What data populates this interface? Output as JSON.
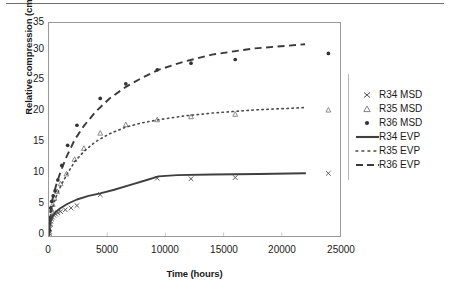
{
  "chart_data": {
    "type": "scatter",
    "title": "",
    "xlabel": "Time (hours)",
    "ylabel": "Relative compression (cm)",
    "xlim": [
      0,
      25000
    ],
    "ylim": [
      0,
      35
    ],
    "xticks": [
      0,
      5000,
      10000,
      15000,
      20000,
      25000
    ],
    "yticks": [
      0,
      5,
      10,
      15,
      20,
      25,
      30,
      35
    ],
    "grid": false,
    "legend_position": "right",
    "series": [
      {
        "name": "R34 MSD",
        "type": "scatter",
        "marker": "x",
        "color": "#555555",
        "points": [
          [
            30,
            0.4
          ],
          [
            70,
            1.2
          ],
          [
            110,
            1.9
          ],
          [
            160,
            2.4
          ],
          [
            220,
            2.8
          ],
          [
            300,
            3.1
          ],
          [
            420,
            3.4
          ],
          [
            560,
            3.6
          ],
          [
            760,
            3.8
          ],
          [
            1000,
            4.0
          ],
          [
            1400,
            4.3
          ],
          [
            1900,
            4.6
          ],
          [
            2400,
            5.0
          ],
          [
            4400,
            6.8
          ],
          [
            9300,
            9.5
          ],
          [
            12200,
            9.4
          ],
          [
            16000,
            9.6
          ],
          [
            24000,
            10.3
          ]
        ]
      },
      {
        "name": "R35 MSD",
        "type": "scatter",
        "marker": "triangle",
        "color": "#777777",
        "points": [
          [
            30,
            0.6
          ],
          [
            80,
            2.0
          ],
          [
            140,
            3.2
          ],
          [
            220,
            4.3
          ],
          [
            330,
            5.2
          ],
          [
            480,
            6.2
          ],
          [
            700,
            7.3
          ],
          [
            1000,
            8.6
          ],
          [
            1500,
            10.2
          ],
          [
            2200,
            12.6
          ],
          [
            3000,
            14.4
          ],
          [
            4400,
            16.9
          ],
          [
            6600,
            18.3
          ],
          [
            9300,
            19.1
          ],
          [
            12200,
            19.6
          ],
          [
            16000,
            20.0
          ],
          [
            24000,
            20.7
          ]
        ]
      },
      {
        "name": "R36 MSD",
        "type": "scatter",
        "marker": "dot",
        "color": "#333333",
        "points": [
          [
            30,
            1.0
          ],
          [
            90,
            3.0
          ],
          [
            150,
            4.6
          ],
          [
            240,
            5.7
          ],
          [
            360,
            6.6
          ],
          [
            520,
            7.4
          ],
          [
            760,
            9.2
          ],
          [
            1100,
            11.6
          ],
          [
            1600,
            14.9
          ],
          [
            2400,
            18.2
          ],
          [
            4400,
            22.6
          ],
          [
            6600,
            25.0
          ],
          [
            9300,
            27.3
          ],
          [
            12200,
            28.4
          ],
          [
            16000,
            29.0
          ],
          [
            24000,
            30.0
          ]
        ]
      },
      {
        "name": "R34 EVP",
        "type": "line",
        "style": "solid",
        "color": "#3f3f3f",
        "points": [
          [
            0,
            0
          ],
          [
            60,
            1.6
          ],
          [
            150,
            2.6
          ],
          [
            300,
            3.3
          ],
          [
            600,
            4.0
          ],
          [
            1000,
            4.6
          ],
          [
            1600,
            5.3
          ],
          [
            2400,
            6.0
          ],
          [
            3400,
            6.6
          ],
          [
            4400,
            7.0
          ],
          [
            5600,
            7.6
          ],
          [
            7000,
            8.4
          ],
          [
            8400,
            9.2
          ],
          [
            9400,
            9.8
          ],
          [
            11000,
            10.0
          ],
          [
            14000,
            10.1
          ],
          [
            18000,
            10.2
          ],
          [
            22000,
            10.3
          ]
        ]
      },
      {
        "name": "R35 EVP",
        "type": "line",
        "style": "dotted",
        "color": "#4a4a4a",
        "points": [
          [
            0,
            0
          ],
          [
            60,
            1.8
          ],
          [
            160,
            3.4
          ],
          [
            320,
            4.8
          ],
          [
            600,
            6.4
          ],
          [
            1000,
            8.2
          ],
          [
            1500,
            10.0
          ],
          [
            2200,
            12.2
          ],
          [
            3000,
            13.9
          ],
          [
            4000,
            15.5
          ],
          [
            5200,
            16.8
          ],
          [
            6600,
            17.9
          ],
          [
            8000,
            18.6
          ],
          [
            9400,
            19.1
          ],
          [
            11500,
            19.7
          ],
          [
            14000,
            20.2
          ],
          [
            17500,
            20.7
          ],
          [
            22000,
            21.1
          ]
        ]
      },
      {
        "name": "R36 EVP",
        "type": "line",
        "style": "dashed",
        "color": "#3a3a3a",
        "points": [
          [
            0,
            0
          ],
          [
            70,
            2.6
          ],
          [
            180,
            4.8
          ],
          [
            360,
            6.6
          ],
          [
            650,
            8.6
          ],
          [
            1000,
            10.6
          ],
          [
            1500,
            13.0
          ],
          [
            2200,
            15.8
          ],
          [
            3000,
            18.1
          ],
          [
            4000,
            20.4
          ],
          [
            5200,
            22.6
          ],
          [
            6600,
            24.5
          ],
          [
            8000,
            26.0
          ],
          [
            9400,
            27.3
          ],
          [
            11500,
            28.6
          ],
          [
            14000,
            29.8
          ],
          [
            17500,
            30.8
          ],
          [
            22000,
            31.5
          ]
        ]
      }
    ]
  },
  "axes": {
    "ylabel": "Relative compression (cm)",
    "xlabel": "Time (hours)",
    "yticks": [
      "0",
      "5",
      "10",
      "15",
      "20",
      "25",
      "30",
      "35"
    ],
    "xticks": [
      "0",
      "5000",
      "10000",
      "15000",
      "20000",
      "25000"
    ]
  },
  "legend": {
    "items": [
      {
        "label": "R34 MSD",
        "key": "marker-x"
      },
      {
        "label": "R35 MSD",
        "key": "marker-triangle"
      },
      {
        "label": "R36 MSD",
        "key": "marker-dot"
      },
      {
        "label": "R34 EVP",
        "key": "line-solid"
      },
      {
        "label": "R35 EVP",
        "key": "line-dotted"
      },
      {
        "label": "R36 EVP",
        "key": "line-dashed"
      }
    ]
  }
}
